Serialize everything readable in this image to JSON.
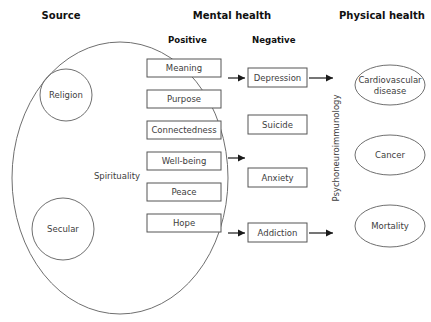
{
  "headers": [
    {
      "label": "Source",
      "x": 61,
      "y": 16
    },
    {
      "label": "Mental health",
      "x": 232,
      "y": 16
    },
    {
      "label": "Physical health",
      "x": 382,
      "y": 16
    }
  ],
  "subheaders": [
    {
      "label": "Positive",
      "x": 168,
      "y": 40
    },
    {
      "label": "Negative",
      "x": 252,
      "y": 40
    }
  ],
  "source": {
    "outer_label": "Spirituality",
    "outer_label_x": 140,
    "outer_label_y": 176,
    "ellipse": {
      "cx": 120,
      "cy": 178,
      "rx": 108,
      "ry": 136
    },
    "circles": [
      {
        "label": "Religion",
        "cx": 66,
        "cy": 95,
        "r": 26
      },
      {
        "label": "Secular",
        "cx": 63,
        "cy": 229,
        "r": 31
      }
    ]
  },
  "positive_boxes": [
    {
      "label": "Meaning",
      "x": 147,
      "y": 59,
      "w": 74,
      "h": 18
    },
    {
      "label": "Purpose",
      "x": 147,
      "y": 90,
      "w": 74,
      "h": 18
    },
    {
      "label": "Connectedness",
      "x": 147,
      "y": 121,
      "w": 74,
      "h": 18
    },
    {
      "label": "Well-being",
      "x": 147,
      "y": 152,
      "w": 74,
      "h": 18
    },
    {
      "label": "Peace",
      "x": 147,
      "y": 183,
      "w": 74,
      "h": 18
    },
    {
      "label": "Hope",
      "x": 147,
      "y": 214,
      "w": 74,
      "h": 18
    }
  ],
  "negative_boxes": [
    {
      "label": "Depression",
      "x": 248,
      "y": 68,
      "w": 59,
      "h": 19
    },
    {
      "label": "Suicide",
      "x": 248,
      "y": 115,
      "w": 59,
      "h": 19
    },
    {
      "label": "Anxiety",
      "x": 248,
      "y": 168,
      "w": 59,
      "h": 19
    },
    {
      "label": "Addiction",
      "x": 248,
      "y": 223,
      "w": 59,
      "h": 19
    }
  ],
  "outcome_ellipses": [
    {
      "label_lines": [
        "Cardiovascular",
        "disease"
      ],
      "cx": 390,
      "cy": 85,
      "rx": 35,
      "ry": 20
    },
    {
      "label_lines": [
        "Cancer"
      ],
      "cx": 390,
      "cy": 155,
      "rx": 35,
      "ry": 20
    },
    {
      "label_lines": [
        "Mortality"
      ],
      "cx": 390,
      "cy": 226,
      "rx": 35,
      "ry": 21
    }
  ],
  "mediator": {
    "label": "Psychoneuroimmunology",
    "x": 336,
    "y": 148,
    "rotation": -90
  },
  "arrows": [
    {
      "name": "arrow-positive-to-depression",
      "x1": 228,
      "y1": 78,
      "x2": 245,
      "y2": 78
    },
    {
      "name": "arrow-positive-to-middle",
      "x1": 228,
      "y1": 158,
      "x2": 245,
      "y2": 158
    },
    {
      "name": "arrow-positive-to-addiction",
      "x1": 228,
      "y1": 233,
      "x2": 245,
      "y2": 233
    },
    {
      "name": "arrow-depression-to-pni",
      "x1": 309,
      "y1": 78,
      "x2": 333,
      "y2": 78
    },
    {
      "name": "arrow-addiction-to-pni",
      "x1": 309,
      "y1": 233,
      "x2": 333,
      "y2": 233
    }
  ],
  "colors": {
    "background": "#ffffff",
    "shape_stroke": "#6f6f6f",
    "box_stroke": "#555555",
    "arrow": "#1a1a1a",
    "text": "#3d3d3d",
    "header_text": "#111111"
  }
}
